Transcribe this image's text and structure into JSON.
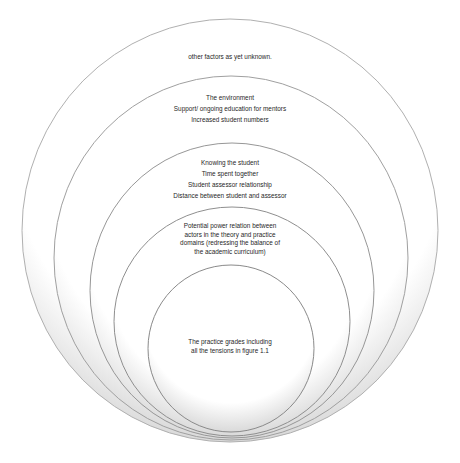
{
  "diagram": {
    "type": "nested-circles",
    "rings": [
      {
        "level": 1,
        "label_lines": [
          "other factors as yet unknown."
        ]
      },
      {
        "level": 2,
        "label_lines": [
          "The environment",
          "Support/ ongoing education for mentors",
          "Increased student numbers"
        ]
      },
      {
        "level": 3,
        "label_lines": [
          "Knowing the student",
          "Time spent together",
          "Student assessor relationship",
          "Distance between student and assessor"
        ]
      },
      {
        "level": 4,
        "label_lines": [
          "Potential power relation between",
          "actors in the theory and practice",
          "domains (redressing the balance of",
          "the academic curriculum)"
        ]
      },
      {
        "level": 5,
        "label_lines": [
          "The practice grades including",
          "all the tensions in figure 1.1"
        ]
      }
    ],
    "colors": {
      "stroke": "#8a8a8a",
      "fill_edge": "#d9d9d9",
      "fill_center": "#ffffff",
      "text": "#1f1f1f"
    }
  }
}
